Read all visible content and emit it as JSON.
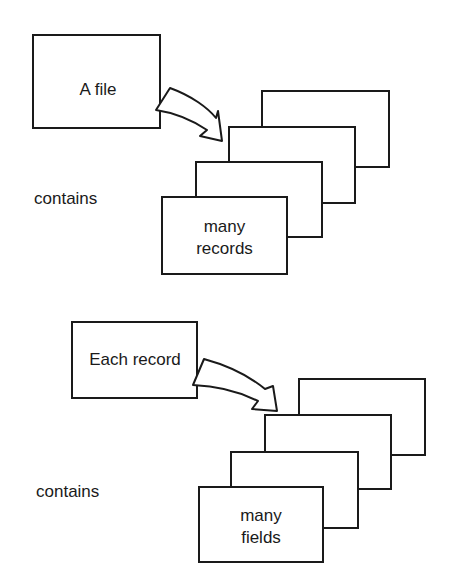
{
  "diagram": {
    "top": {
      "source_label": "A file",
      "relation": "contains",
      "target_line1": "many",
      "target_line2": "records"
    },
    "bottom": {
      "source_label": "Each record",
      "relation": "contains",
      "target_line1": "many",
      "target_line2": "fields"
    }
  }
}
